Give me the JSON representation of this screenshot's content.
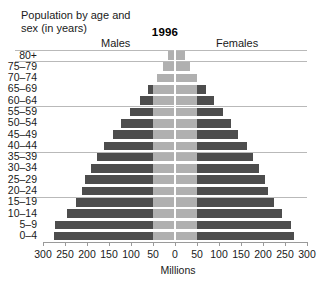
{
  "header": {
    "title": "Population by age and\nsex (in years)",
    "year": "1996",
    "males_label": "Males",
    "females_label": "Females"
  },
  "axis": {
    "xlabel": "Millions",
    "ticks": [
      300,
      250,
      200,
      150,
      100,
      50,
      0,
      50,
      100,
      150,
      200,
      250,
      300
    ],
    "tick_labels": [
      "300",
      "250",
      "200",
      "150",
      "100",
      "50",
      "0",
      "50",
      "100",
      "150",
      "200",
      "250",
      "300"
    ],
    "max": 300
  },
  "colors": {
    "bar_dark": "#4d4d4d",
    "bar_light": "#b0b0b0",
    "gridline": "#b9b9b9",
    "axis": "#9a9a9a",
    "text": "#1a1a1a",
    "background": "#ffffff"
  },
  "chart_data": {
    "type": "bar",
    "subtype": "population-pyramid",
    "title": "Population by age and sex (in years)",
    "annotation": "1996",
    "xlabel": "Millions",
    "ylabel": "",
    "xlim": [
      -300,
      300
    ],
    "grid": true,
    "legend_position": "top",
    "categories": [
      "80+",
      "75–79",
      "70–74",
      "65–69",
      "60–64",
      "55–59",
      "50–54",
      "45–49",
      "40–44",
      "35–39",
      "30–34",
      "25–29",
      "20–24",
      "15–19",
      "10–14",
      "5–9",
      "0–4"
    ],
    "series": [
      {
        "name": "Males",
        "side": "left",
        "values": [
          15,
          27,
          42,
          62,
          80,
          102,
          122,
          140,
          162,
          178,
          192,
          205,
          212,
          226,
          245,
          272,
          276
        ]
      },
      {
        "name": "Females",
        "side": "right",
        "values": [
          22,
          34,
          50,
          70,
          88,
          108,
          128,
          143,
          163,
          178,
          192,
          205,
          212,
          224,
          243,
          263,
          270
        ]
      }
    ],
    "gridline_after_categories": [
      "80+",
      "60–64",
      "40–44",
      "20–24"
    ]
  }
}
